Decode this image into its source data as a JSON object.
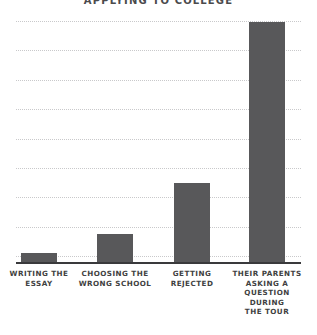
{
  "chart_data": {
    "type": "bar",
    "title": "APPLYING TO COLLEGE",
    "xlabel": "",
    "ylabel": "",
    "categories": [
      "WRITING THE\nESSAY",
      "CHOOSING THE\nWRONG SCHOOL",
      "GETTING\nREJECTED",
      "THEIR PARENTS\nASKING A\nQUESTION DURING\nTHE TOUR"
    ],
    "values": [
      4,
      12,
      33,
      100
    ],
    "ylim": [
      0,
      100
    ],
    "grid": true,
    "gridline_count": 9,
    "legend": "none",
    "style": "hand-drawn",
    "bar_color": "#58585a",
    "gridline_color": "#c9c9cb",
    "axis_color": "#3a3a3c",
    "background_color": "#ffffff",
    "tick_labels_y": [],
    "annotations": []
  },
  "layout": {
    "bar_width_px": 36,
    "bar_centers_px": [
      39,
      115,
      192,
      267
    ]
  }
}
